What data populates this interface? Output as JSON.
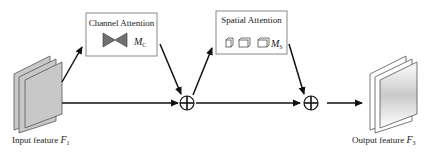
{
  "diagram": {
    "type": "CBAM attention block",
    "nodes": {
      "input": {
        "label": "Input feature",
        "symbol": "F",
        "subscript": "1"
      },
      "channel_attention": {
        "title": "Channel Attention",
        "symbol": "M",
        "subscript": "C"
      },
      "spatial_attention": {
        "title": "Spatial Attention",
        "symbol": "M",
        "subscript": "S"
      },
      "add1": {
        "glyph": "⊕"
      },
      "add2": {
        "glyph": "⊕"
      },
      "output": {
        "label": "Output feature",
        "symbol": "F",
        "subscript": "3"
      }
    },
    "edges": [
      [
        "input",
        "channel_attention"
      ],
      [
        "channel_attention",
        "add1"
      ],
      [
        "input",
        "add1"
      ],
      [
        "add1",
        "spatial_attention"
      ],
      [
        "spatial_attention",
        "add2"
      ],
      [
        "add1",
        "add2"
      ],
      [
        "add2",
        "output"
      ]
    ],
    "colors": {
      "stroke": "#111111",
      "box_border": "#888888",
      "feature_fill": "#c8c8c8",
      "bowtie": "#707070"
    }
  }
}
